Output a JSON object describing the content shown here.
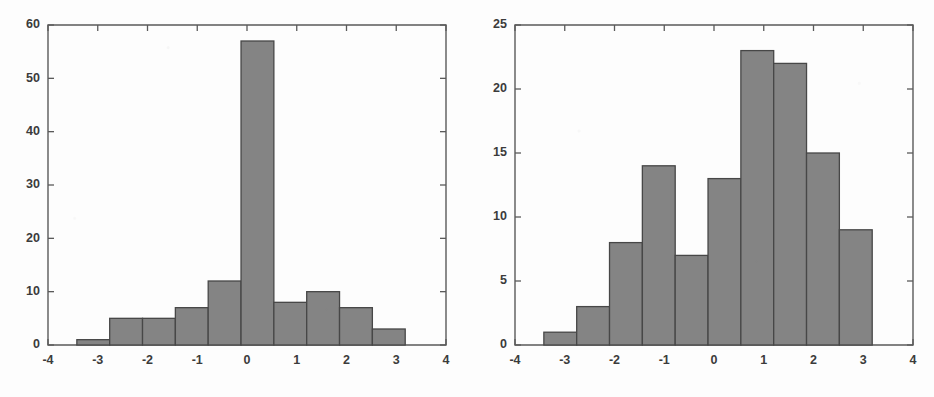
{
  "figure": {
    "background_color": "#fdfdfd",
    "bar_fill_color": "#848484",
    "bar_edge_color": "#474747",
    "axis_color": "#5a5a5a"
  },
  "chart_data": [
    {
      "type": "bar",
      "title": "",
      "subtitle": "",
      "xlabel": "",
      "ylabel": "",
      "xlim": [
        -4,
        4
      ],
      "ylim": [
        0,
        60
      ],
      "grid": false,
      "legend": null,
      "position": "left",
      "xticks": [
        -4,
        -3,
        -2,
        -1,
        0,
        1,
        2,
        3,
        4
      ],
      "xticklabels": [
        "-4",
        "-3",
        "-2",
        "-1",
        "0",
        "1",
        "2",
        "3",
        "4"
      ],
      "yticks": [
        0,
        10,
        20,
        30,
        40,
        50,
        60
      ],
      "yticklabels": [
        "0",
        "10",
        "20",
        "30",
        "40",
        "50",
        "60"
      ],
      "bin_edges": [
        -3.42,
        -2.76,
        -2.1,
        -1.44,
        -0.78,
        -0.12,
        0.54,
        1.2,
        1.86,
        2.52,
        3.18
      ],
      "bin_centers": [
        -3.09,
        -2.43,
        -1.77,
        -1.11,
        -0.45,
        0.21,
        0.87,
        1.53,
        2.19,
        2.85
      ],
      "categories": [
        "-3.09",
        "-2.43",
        "-1.77",
        "-1.11",
        "-0.45",
        "0.21",
        "0.87",
        "1.53",
        "2.19",
        "2.85"
      ],
      "values": [
        1,
        5,
        5,
        7,
        12,
        57,
        8,
        10,
        7,
        3
      ]
    },
    {
      "type": "bar",
      "title": "",
      "subtitle": "",
      "xlabel": "",
      "ylabel": "",
      "xlim": [
        -4,
        4
      ],
      "ylim": [
        0,
        25
      ],
      "grid": false,
      "legend": null,
      "position": "right",
      "xticks": [
        -4,
        -3,
        -2,
        -1,
        0,
        1,
        2,
        3,
        4
      ],
      "xticklabels": [
        "-4",
        "-3",
        "-2",
        "-1",
        "0",
        "1",
        "2",
        "3",
        "4"
      ],
      "yticks": [
        0,
        5,
        10,
        15,
        20,
        25
      ],
      "yticklabels": [
        "0",
        "5",
        "10",
        "15",
        "20",
        "25"
      ],
      "bin_edges": [
        -3.42,
        -2.76,
        -2.1,
        -1.44,
        -0.78,
        -0.12,
        0.54,
        1.2,
        1.86,
        2.52,
        3.18
      ],
      "bin_centers": [
        -3.09,
        -2.43,
        -1.77,
        -1.11,
        -0.45,
        0.21,
        0.87,
        1.53,
        2.19,
        2.85
      ],
      "categories": [
        "-3.09",
        "-2.43",
        "-1.77",
        "-1.11",
        "-0.45",
        "0.21",
        "0.87",
        "1.53",
        "2.19",
        "2.85"
      ],
      "values": [
        1,
        3,
        8,
        14,
        7,
        13,
        23,
        22,
        15,
        9
      ]
    }
  ]
}
